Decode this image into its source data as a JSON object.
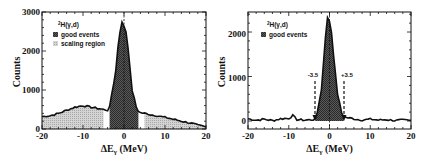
{
  "chart_data": [
    {
      "type": "area",
      "panel": "left",
      "xlabel": "ΔEγ (MeV)",
      "ylabel": "Counts",
      "xlim": [
        -20,
        20
      ],
      "ylim": [
        0,
        3000
      ],
      "xticks": [
        -20,
        -10,
        0,
        10,
        20
      ],
      "yticks": [
        0,
        1000,
        2000,
        3000
      ],
      "xtick_labels": [
        "-20",
        "-10",
        "0",
        "10",
        "20"
      ],
      "ytick_labels": [
        "0",
        "1000",
        "2000",
        "3000"
      ],
      "legend": {
        "title": "²H(γ,d)",
        "entries": [
          {
            "label": "good events",
            "fill": "dark-crosshatch"
          },
          {
            "label": "scaling region",
            "fill": "light-dots"
          }
        ],
        "position": "upper-left"
      },
      "vline": 0,
      "regions": [
        {
          "name": "scaling region",
          "x": [
            -20,
            -5
          ]
        },
        {
          "name": "good events",
          "x": [
            -3.5,
            3.5
          ]
        },
        {
          "name": "scaling region",
          "x": [
            5,
            20
          ]
        }
      ],
      "x": [
        -20,
        -18,
        -16,
        -14,
        -12,
        -10,
        -8,
        -6,
        -5,
        -4,
        -3.5,
        -3,
        -2,
        -1.5,
        -1,
        -0.5,
        0,
        0.5,
        1,
        1.5,
        2,
        3,
        3.5,
        4,
        5,
        6,
        8,
        10,
        12,
        14,
        16,
        18,
        20
      ],
      "values": [
        320,
        340,
        400,
        480,
        560,
        600,
        560,
        520,
        500,
        480,
        560,
        900,
        1500,
        2100,
        2500,
        2720,
        2650,
        2500,
        2100,
        1500,
        1000,
        560,
        460,
        420,
        400,
        380,
        340,
        300,
        250,
        200,
        160,
        100,
        50
      ]
    },
    {
      "type": "area",
      "panel": "right",
      "xlabel": "ΔEγ (MeV)",
      "ylabel": "Counts",
      "xlim": [
        -20,
        20
      ],
      "ylim": [
        -100,
        2450
      ],
      "xticks": [
        -20,
        -10,
        0,
        10,
        20
      ],
      "yticks": [
        0,
        1000,
        2000
      ],
      "xtick_labels": [
        "-20",
        "-10",
        "0",
        "10",
        "20"
      ],
      "ytick_labels": [
        "0",
        "1000",
        "2000"
      ],
      "legend": {
        "title": "²H(γ,d)",
        "entries": [
          {
            "label": "good events",
            "fill": "dark-crosshatch"
          }
        ],
        "position": "upper-left"
      },
      "vline": 0,
      "annotations": [
        {
          "text": "-3.5",
          "x": -3.5,
          "arrow": "dashed-down"
        },
        {
          "text": "+3.5",
          "x": 3.5,
          "arrow": "dashed-down"
        }
      ],
      "regions": [
        {
          "name": "good events",
          "x": [
            -3.5,
            3.5
          ]
        }
      ],
      "x": [
        -20,
        -18,
        -16,
        -14,
        -12,
        -10,
        -9,
        -8,
        -6,
        -4,
        -3.5,
        -3,
        -2,
        -1.5,
        -1,
        -0.5,
        0,
        0.5,
        1,
        1.5,
        2,
        3,
        3.5,
        4,
        6,
        8,
        10,
        12,
        14,
        16,
        18,
        20
      ],
      "values": [
        50,
        20,
        40,
        10,
        50,
        60,
        120,
        30,
        20,
        30,
        40,
        200,
        700,
        1300,
        1900,
        2300,
        2250,
        2000,
        1500,
        1000,
        600,
        180,
        100,
        80,
        50,
        20,
        40,
        20,
        30,
        10,
        20,
        10
      ]
    }
  ],
  "labels": {
    "left": {
      "xlabel": "ΔE",
      "xsub": "γ",
      "xunit": " (MeV)",
      "ylabel": "Counts",
      "yticks": [
        "0",
        "1000",
        "2000",
        "3000"
      ],
      "xticks": [
        "-20",
        "-10",
        "0",
        "10",
        "20"
      ],
      "legend_title_sup": "2",
      "legend_title": "H(γ,d)",
      "legend_good": "good events",
      "legend_scaling": "scaling region"
    },
    "right": {
      "xlabel": "ΔE",
      "xsub": "γ",
      "xunit": " (MeV)",
      "ylabel": "Counts",
      "yticks": [
        "0",
        "1000",
        "2000"
      ],
      "xticks": [
        "-20",
        "-10",
        "0",
        "10",
        "20"
      ],
      "legend_title_sup": "2",
      "legend_title": "H(γ,d)",
      "legend_good": "good events",
      "anno_left": "-3.5",
      "anno_right": "+3.5"
    }
  }
}
